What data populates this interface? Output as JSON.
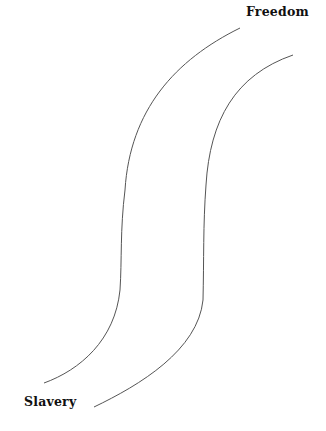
{
  "diagram": {
    "type": "path-diagram",
    "labels": {
      "top": "Freedom",
      "bottom": "Slavery"
    },
    "colors": {
      "line": "#555555",
      "text": "#111111",
      "background": "#ffffff"
    }
  }
}
